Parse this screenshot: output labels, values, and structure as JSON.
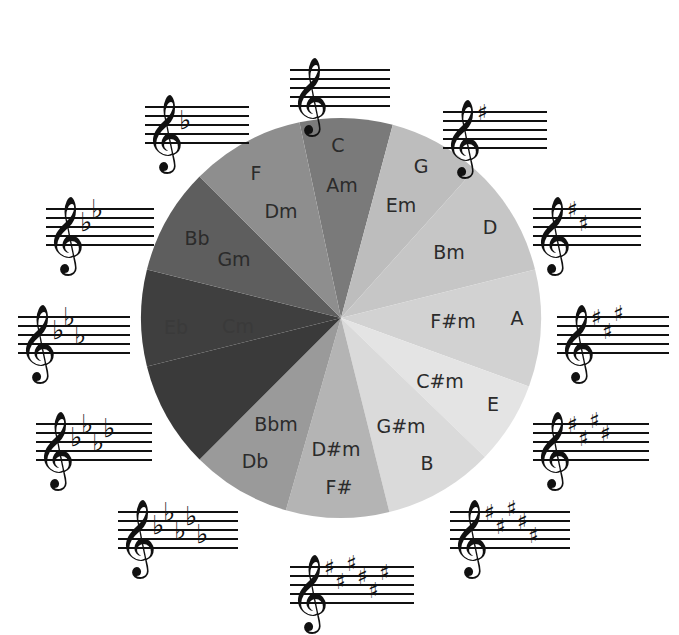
{
  "pie": {
    "center": [
      341,
      318
    ],
    "radius": 200,
    "wedges": [
      {
        "major": "C",
        "minor": "Am",
        "start": -12,
        "end": 15,
        "color": "#7a7a7a",
        "major_pos": [
          338,
          152
        ],
        "minor_pos": [
          342,
          192
        ]
      },
      {
        "major": "G",
        "minor": "Em",
        "start": 15,
        "end": 42,
        "color": "#bdbdbd",
        "major_pos": [
          421,
          173
        ],
        "minor_pos": [
          401,
          212
        ]
      },
      {
        "major": "D",
        "minor": "Bm",
        "start": 42,
        "end": 76,
        "color": "#c6c6c6",
        "major_pos": [
          490,
          234
        ],
        "minor_pos": [
          449,
          259
        ]
      },
      {
        "major": "A",
        "minor": "F#m",
        "start": 76,
        "end": 110,
        "color": "#d2d2d2",
        "major_pos": [
          517,
          325
        ],
        "minor_pos": [
          453,
          328
        ]
      },
      {
        "major": "E",
        "minor": "C#m",
        "start": 110,
        "end": 134,
        "color": "#e4e4e4",
        "major_pos": [
          493,
          411
        ],
        "minor_pos": [
          440,
          388
        ]
      },
      {
        "major": "B",
        "minor": "G#m",
        "start": 134,
        "end": 166,
        "color": "#dadada",
        "major_pos": [
          427,
          470
        ],
        "minor_pos": [
          401,
          433
        ]
      },
      {
        "major": "F#",
        "minor": "D#m",
        "start": 166,
        "end": 196,
        "color": "#b4b4b4",
        "major_pos": [
          339,
          494
        ],
        "minor_pos": [
          336,
          456
        ]
      },
      {
        "major": "Db",
        "minor": "Bbm",
        "start": 196,
        "end": 225,
        "color": "#9a9a9a",
        "major_pos": [
          255,
          468
        ],
        "minor_pos": [
          276,
          431
        ]
      },
      {
        "major": "Ab",
        "minor": "Fm",
        "start": 225,
        "end": 256,
        "color": "#3a3a3a",
        "major_pos": [
          199,
          404
        ],
        "minor_pos": [
          230,
          386
        ]
      },
      {
        "major": "Eb",
        "minor": "Cm",
        "start": 256,
        "end": 284,
        "color": "#3f3f3f",
        "major_pos": [
          176,
          334
        ],
        "minor_pos": [
          238,
          333
        ]
      },
      {
        "major": "Bb",
        "minor": "Gm",
        "start": 284,
        "end": 315,
        "color": "#5e5e5e",
        "major_pos": [
          197,
          245
        ],
        "minor_pos": [
          234,
          266
        ]
      },
      {
        "major": "F",
        "minor": "Dm",
        "start": 315,
        "end": 348,
        "color": "#8e8e8e",
        "major_pos": [
          256,
          180
        ],
        "minor_pos": [
          281,
          218
        ]
      }
    ]
  },
  "key_signatures": [
    {
      "key": "C",
      "accidental": "none",
      "count": 0,
      "x": 290,
      "y": 48
    },
    {
      "key": "G",
      "accidental": "sharp",
      "count": 1,
      "x": 443,
      "y": 90
    },
    {
      "key": "D",
      "accidental": "sharp",
      "count": 2,
      "x": 533,
      "y": 187
    },
    {
      "key": "A",
      "accidental": "sharp",
      "count": 3,
      "x": 557,
      "y": 295
    },
    {
      "key": "E",
      "accidental": "sharp",
      "count": 4,
      "x": 533,
      "y": 402
    },
    {
      "key": "B",
      "accidental": "sharp",
      "count": 5,
      "x": 450,
      "y": 490
    },
    {
      "key": "F#",
      "accidental": "sharp",
      "count": 6,
      "x": 290,
      "y": 545
    },
    {
      "key": "Db",
      "accidental": "flat",
      "count": 5,
      "x": 118,
      "y": 490
    },
    {
      "key": "Ab",
      "accidental": "flat",
      "count": 4,
      "x": 36,
      "y": 402
    },
    {
      "key": "Eb",
      "accidental": "flat",
      "count": 3,
      "x": 18,
      "y": 295
    },
    {
      "key": "Bb",
      "accidental": "flat",
      "count": 2,
      "x": 46,
      "y": 187
    },
    {
      "key": "F",
      "accidental": "flat",
      "count": 1,
      "x": 145,
      "y": 85
    }
  ],
  "symbols": {
    "treble_clef": "𝄞",
    "sharp": "♯",
    "flat": "♭"
  }
}
